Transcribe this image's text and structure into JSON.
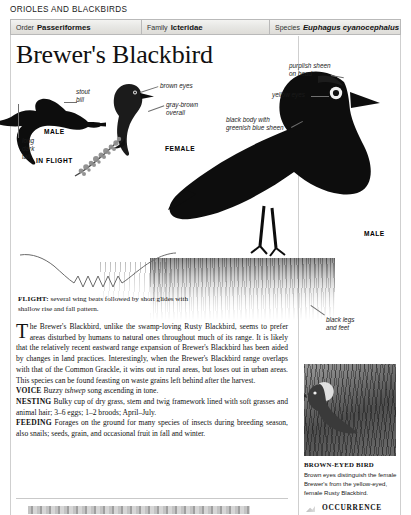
{
  "running_head": "ORIOLES AND BLACKBIRDS",
  "taxonomy": {
    "order_label": "Order",
    "order_value": "Passeriformes",
    "family_label": "Family",
    "family_value": "Icteridae",
    "species_label": "Species",
    "species_value": "Euphagus cyanocephalus"
  },
  "title": "Brewer's Blackbird",
  "callouts": {
    "stout_bill": "stout\nbill",
    "long_dark_tail": "long\ndark\ntail",
    "brown_eyes": "brown eyes",
    "gray_brown_overall": "gray-brown\noverall",
    "purplish_sheen": "purplish sheen\non head",
    "yellow_eyes": "yellow eyes",
    "black_body": "black body with\ngreenish blue sheen",
    "black_legs": "black legs\nand feet"
  },
  "plate_labels": {
    "male_flight": "MALE",
    "in_flight": "IN FLIGHT",
    "female": "FEMALE",
    "male_perched": "MALE"
  },
  "flight": {
    "heading": "FLIGHT:",
    "text": "several wing beats followed by short glides with shallow rise and fall pattern."
  },
  "body": {
    "dropcap": "T",
    "intro": "he Brewer's Blackbird, unlike the swamp-loving Rusty Blackbird, seems to prefer areas disturbed by humans to natural ones throughout much of its range. It is likely that the relatively recent eastward range expansion of Brewer's Blackbird has been aided by changes in land practices. Interestingly, when the Brewer's Blackbird range overlaps with that of the Common Grackle, it wins out in rural areas, but loses out in urban areas. This species can be found feasting on waste grains left behind after the harvest.",
    "voice_label": "VOICE",
    "voice_pre": " Buzzy ",
    "voice_italic": "tshwep",
    "voice_post": " song ascending in tone.",
    "nesting_label": "NESTING",
    "nesting_text": " Bulky cup of dry grass, stem and twig framework lined with soft grasses and animal hair; 3–6 eggs; 1–2 broods; April–July.",
    "feeding_label": "FEEDING",
    "feeding_text": " Forages on the ground for many species of insects during breeding season, also snails; seeds, grain, and occasional fruit in fall and winter."
  },
  "sidebar": {
    "photo_caption_heading": "BROWN-EYED BIRD",
    "photo_caption_body": "Brown eyes distinguish the female Brewer's from the yellow-eyed, female Rusty Blackbird.",
    "occurrence_heading": "OCCURRENCE"
  },
  "colors": {
    "bird": "#0d0d0d",
    "rule": "#cfcfcf",
    "header_bg": "#e9e9e6",
    "text": "#111111"
  }
}
